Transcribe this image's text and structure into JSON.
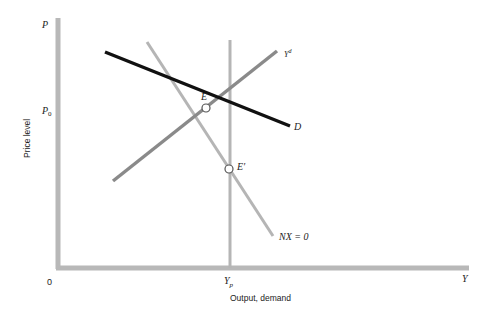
{
  "diagram": {
    "title": "",
    "axes": {
      "y_axis_symbol": "P",
      "y_axis_label": "Price level",
      "y_tick_label": "P",
      "y_tick_subscript": "0",
      "x_axis_symbol": "Y",
      "x_axis_label": "Output, demand",
      "origin_label": "0",
      "x_tick_label": "Y",
      "x_tick_subscript": "p"
    },
    "curves": [
      {
        "id": "D",
        "label": "D",
        "color": "#111111"
      },
      {
        "id": "Yd",
        "label": "Y",
        "superscript": "d",
        "color": "#8a8a8a"
      },
      {
        "id": "NX0",
        "label": "NX = 0",
        "color": "#b5b5b5"
      },
      {
        "id": "Yp",
        "label": "",
        "color": "#b5b5b5"
      }
    ],
    "points": [
      {
        "id": "E",
        "label": "E"
      },
      {
        "id": "E_prime",
        "label": "E′"
      }
    ],
    "colors": {
      "axis": "#b8b8b8",
      "demand": "#111111",
      "aggregate_demand": "#8a8a8a",
      "nx_zero": "#b5b5b5",
      "potential_output": "#b5b5b5"
    }
  }
}
